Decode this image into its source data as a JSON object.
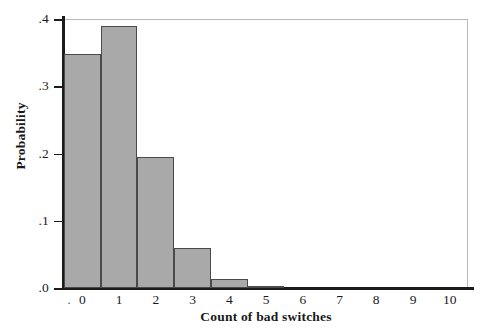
{
  "figure": {
    "background_color": "#ffffff",
    "bar_fill_color": "#a9a9a9",
    "bar_edge_color": "#4a4a4a",
    "axis_color": "#1b1b1b",
    "frame_color": "#b9b9b9"
  },
  "chart_data": {
    "type": "bar",
    "title": "",
    "subtitle": "",
    "xlabel": "Count of bad switches",
    "ylabel": "Probability",
    "categories": [
      "0",
      "1",
      "2",
      "3",
      "4",
      "5",
      "6",
      "7",
      "8",
      "9",
      "10"
    ],
    "values": [
      0.348,
      0.39,
      0.195,
      0.06,
      0.013,
      0.002,
      0.0,
      0.0,
      0.0,
      0.0,
      0.0
    ],
    "xlim": [
      -0.5,
      10.5
    ],
    "ylim": [
      0.0,
      0.4
    ],
    "xticks": [
      "0",
      "1",
      "2",
      "3",
      "4",
      "5",
      "6",
      "7",
      "8",
      "9",
      "10"
    ],
    "yticks": [
      ".0",
      ".1",
      ".2",
      ".3",
      ".4"
    ],
    "ytick_values": [
      0.0,
      0.1,
      0.2,
      0.3,
      0.4
    ],
    "grid": false,
    "legend": null,
    "legend_position": "none",
    "annotations": [],
    "origin_dash_marker": "·"
  }
}
